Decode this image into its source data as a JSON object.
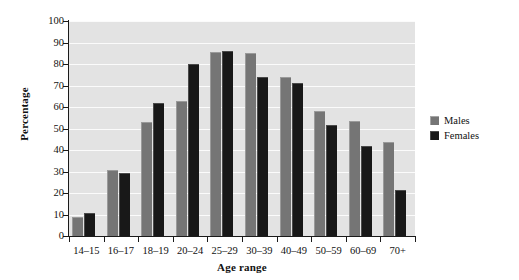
{
  "chart_data": {
    "type": "bar",
    "title": "",
    "xlabel": "Age range",
    "ylabel": "Percentage",
    "ylim": [
      0,
      100
    ],
    "ytick_step": 10,
    "yticks": [
      0,
      10,
      20,
      30,
      40,
      50,
      60,
      70,
      80,
      90,
      100
    ],
    "grid": true,
    "legend_position": "right",
    "categories": [
      "14–15",
      "16–17",
      "18–19",
      "20–24",
      "25–29",
      "30–39",
      "40–49",
      "50–59",
      "60–69",
      "70+"
    ],
    "series": [
      {
        "name": "Males",
        "color": "#757575",
        "values": [
          9,
          30.5,
          53,
          63,
          85.5,
          85,
          74,
          58,
          53.5,
          43.5
        ]
      },
      {
        "name": "Females",
        "color": "#181818",
        "values": [
          10.5,
          29.5,
          62,
          80,
          86,
          74,
          71,
          51.5,
          42,
          21.5
        ]
      }
    ]
  },
  "legend": {
    "items": [
      {
        "label": "Males"
      },
      {
        "label": "Females"
      }
    ]
  },
  "colors": {
    "plot_background": "#e3e3e3",
    "gridline": "#fbfbfb",
    "axis": "#1a1a1a",
    "males": "#757575",
    "females": "#181818"
  }
}
